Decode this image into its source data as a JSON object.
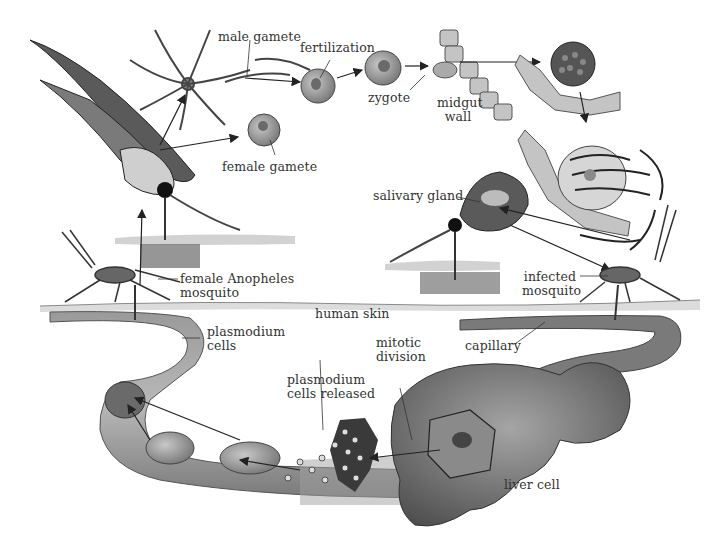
{
  "diagram": {
    "colors": {
      "ink": "#2a2a2a",
      "label": "#333333",
      "vessel": "#8a8a8a",
      "vessel_dark": "#5a5a5a",
      "cell": "#9a9a9a",
      "skin": "#d8d8d8",
      "background": "#ffffff"
    },
    "labels": {
      "male_gamete": "male gamete",
      "fertilization": "fertilization",
      "zygote": "zygote",
      "midgut_wall_1": "midgut",
      "midgut_wall_2": "wall",
      "female_gamete": "female gamete",
      "salivary_gland": "salivary gland",
      "female_anopheles_1": "female  Anopheles",
      "female_anopheles_2": "mosquito",
      "infected_mosquito_1": "infected",
      "infected_mosquito_2": "mosquito",
      "human_skin": "human skin",
      "plasmodium_cells_1": "plasmodium",
      "plasmodium_cells_2": "cells",
      "capillary": "capillary",
      "mitotic_division_1": "mitotic",
      "mitotic_division_2": "division",
      "plasmodium_released_1": "plasmodium",
      "plasmodium_released_2": "cells released",
      "liver_cell": "liver cell"
    },
    "stages": [
      {
        "id": "female-mosquito-bite",
        "label": "female Anopheles mosquito"
      },
      {
        "id": "gametes",
        "label": "male gamete / female gamete"
      },
      {
        "id": "fertilization",
        "label": "fertilization"
      },
      {
        "id": "zygote",
        "label": "zygote"
      },
      {
        "id": "midgut-wall",
        "label": "midgut wall"
      },
      {
        "id": "salivary-gland",
        "label": "salivary gland"
      },
      {
        "id": "infected-mosquito",
        "label": "infected mosquito"
      },
      {
        "id": "capillary",
        "label": "capillary"
      },
      {
        "id": "liver-cell",
        "label": "liver cell"
      },
      {
        "id": "mitotic-division",
        "label": "mitotic division"
      },
      {
        "id": "plasmodium-cells-released",
        "label": "plasmodium cells released"
      },
      {
        "id": "plasmodium-cells",
        "label": "plasmodium cells"
      }
    ]
  }
}
